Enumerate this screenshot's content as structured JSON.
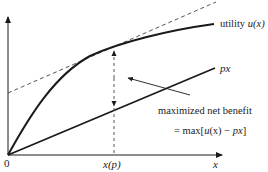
{
  "diagram": {
    "type": "economics-utility-diagram",
    "colors": {
      "line": "#1a1a1a",
      "dashed": "#444444",
      "text": "#222222",
      "background": "#ffffff"
    },
    "axes": {
      "origin_label": "0",
      "x_label": "x",
      "x_tick_label": "x(p)"
    },
    "curves": {
      "utility_label_prefix": "utility ",
      "utility_label_func": "u(x)",
      "cost_label": "px"
    },
    "annotation": {
      "line1": "maximized net benefit",
      "line2_prefix": "= max[",
      "line2_u": "u",
      "line2_mid": "(x) − ",
      "line2_px": "px",
      "line2_suffix": "]"
    }
  }
}
